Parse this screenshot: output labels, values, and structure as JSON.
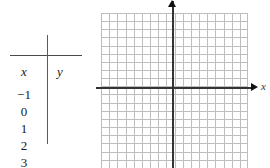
{
  "table": {
    "headers": {
      "x": "x",
      "y": "y"
    },
    "rows": [
      {
        "x": "−1",
        "y": ""
      },
      {
        "x": "0",
        "y": ""
      },
      {
        "x": "1",
        "y": ""
      },
      {
        "x": "2",
        "y": ""
      },
      {
        "x": "3",
        "y": ""
      }
    ]
  },
  "graph": {
    "axis_label_x": "x",
    "axis_label_y": "",
    "grid": {
      "columns": 18,
      "rows": 20,
      "cell_size_px": 8,
      "line_color": "#bdbdbd"
    },
    "axis_color": "#333333",
    "origin": {
      "x_px": 72,
      "y_px": 75
    }
  },
  "colors": {
    "background": "#ffffff",
    "text": "#1a1a1a",
    "rule": "#4a4a4a",
    "gridline": "#bdbdbd",
    "axis": "#333333"
  }
}
